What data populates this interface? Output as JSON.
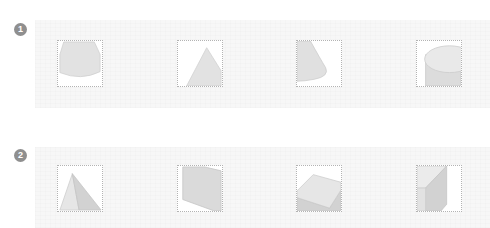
{
  "exercises": [
    {
      "number": "1",
      "views": [
        {
          "shape": "truncated-cone-frustum-view",
          "icon": "frustum-view-icon"
        },
        {
          "shape": "cone-triangle-view",
          "icon": "cone-side-view-icon"
        },
        {
          "shape": "cone-partial-view",
          "icon": "cone-partial-view-icon"
        },
        {
          "shape": "cylinder-partial-view",
          "icon": "cylinder-partial-view-icon"
        }
      ]
    },
    {
      "number": "2",
      "views": [
        {
          "shape": "pyramid-partial-view",
          "icon": "pyramid-view-icon"
        },
        {
          "shape": "quadrilateral-face-view",
          "icon": "quadrilateral-face-icon"
        },
        {
          "shape": "slab-top-partial-view",
          "icon": "slab-partial-view-icon"
        },
        {
          "shape": "prism-corner-partial-view",
          "icon": "prism-corner-view-icon"
        }
      ]
    }
  ],
  "colors": {
    "badge": "#8f8f8f",
    "shape_fill": "#e2e2e2",
    "shape_shade": "#d2d2d2",
    "shape_stroke": "#c4c4c4",
    "frame_border": "#b3b3b3",
    "band": "#f7f7f7"
  }
}
